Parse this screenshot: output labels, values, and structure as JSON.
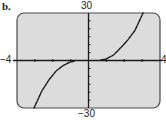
{
  "panel_label": "b.",
  "axes": {
    "x_min_label": "−4",
    "x_max_label": "4",
    "y_max_label": "30",
    "y_min_label": "−30"
  },
  "colors": {
    "plot_background": "#dcdcdc",
    "frame": "#4a4a4a",
    "axis": "#1a1a1a",
    "curve": "#1a1a1a"
  },
  "chart_data": {
    "type": "line",
    "title": "",
    "xlabel": "",
    "ylabel": "",
    "xlim": [
      -4,
      4
    ],
    "ylim": [
      -30,
      30
    ],
    "x_ticks_step": 1,
    "y_ticks_step": 5,
    "grid": false,
    "legend": null,
    "series": [
      {
        "name": "left branch",
        "style": "dashed",
        "x": [
          -3.05,
          -2.6,
          -2.2,
          -1.8,
          -1.4,
          -1.0,
          -0.8
        ],
        "y": [
          -30,
          -19,
          -12,
          -6.5,
          -3,
          -0.8,
          -0.5
        ]
      },
      {
        "name": "right branch",
        "style": "dashed",
        "x": [
          0.7,
          1.0,
          1.4,
          1.8,
          2.2,
          2.6,
          3.05
        ],
        "y": [
          0.3,
          1,
          3.5,
          8,
          13,
          19,
          30
        ]
      }
    ]
  }
}
